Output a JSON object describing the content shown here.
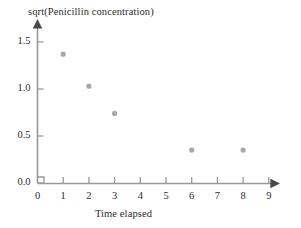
{
  "chart_data": {
    "type": "scatter",
    "title": "",
    "xlabel": "Time elapsed",
    "ylabel": "sqrt(Penicillin concentration)",
    "xlim": [
      0,
      9.6
    ],
    "ylim": [
      0,
      1.72
    ],
    "xticks": [
      "0",
      "1",
      "2",
      "3",
      "4",
      "5",
      "6",
      "7",
      "8",
      "9"
    ],
    "xtick_values": [
      0,
      1,
      2,
      3,
      4,
      5,
      6,
      7,
      8,
      9
    ],
    "yticks": [
      "0.0",
      "0.5",
      "1.0",
      "1.5"
    ],
    "ytick_values": [
      0.0,
      0.5,
      1.0,
      1.5
    ],
    "grid": false,
    "legend": null,
    "series": [
      {
        "name": "sqrt(Penicillin concentration)",
        "marker": "circle",
        "color": "#a8a8a8",
        "points": [
          {
            "x": 1,
            "y": 1.37
          },
          {
            "x": 2,
            "y": 1.03
          },
          {
            "x": 3,
            "y": 0.74
          },
          {
            "x": 6,
            "y": 0.35
          },
          {
            "x": 8,
            "y": 0.35
          }
        ]
      }
    ],
    "axis_color": "#999999",
    "text_color": "#2b2b2b",
    "arrowheads": [
      "x-axis-right",
      "y-axis-top"
    ]
  }
}
